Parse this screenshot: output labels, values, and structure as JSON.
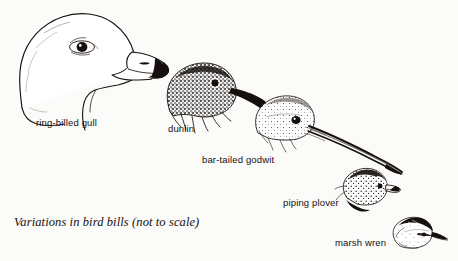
{
  "figure": {
    "caption": "Variations in bird bills (not to scale)",
    "background_color": "#fbfbfa",
    "ink_color": "#15100d",
    "width": 458,
    "height": 261
  },
  "birds": [
    {
      "id": "ring-billed-gull",
      "label": "ring-billed gull",
      "bill_type": "stout hooked bill with dark subterminal ring",
      "size_rank": 1
    },
    {
      "id": "dunlin",
      "label": "dunlin",
      "bill_type": "long slightly down-curved probing bill",
      "size_rank": 2
    },
    {
      "id": "bar-tailed-godwit",
      "label": "bar-tailed godwit",
      "bill_type": "very long slender slightly upturned bill",
      "size_rank": 3
    },
    {
      "id": "piping-plover",
      "label": "piping plover",
      "bill_type": "short stubby bill with dark tip",
      "size_rank": 4
    },
    {
      "id": "marsh-wren",
      "label": "marsh wren",
      "bill_type": "short fine pointed insect bill",
      "size_rank": 5
    }
  ]
}
